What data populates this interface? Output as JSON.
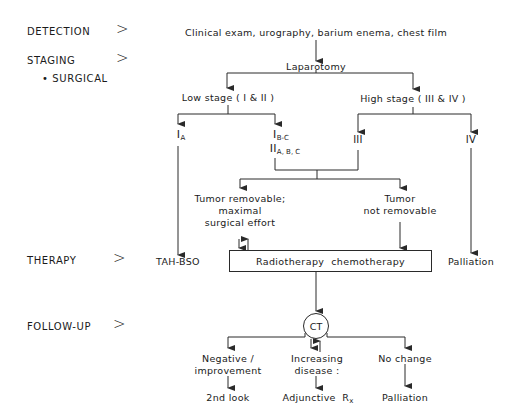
{
  "rows": {
    "detection": "DETECTION",
    "staging": "STAGING",
    "staging_sub": "• SURGICAL",
    "therapy": "THERAPY",
    "follow_up": "FOLLOW-UP",
    "separator": ">"
  },
  "detection": {
    "methods": "Clinical exam, urography, barium enema, chest film"
  },
  "staging": {
    "procedure": "Laparotomy",
    "low_stage": "Low stage ( I & II )",
    "high_stage": "High stage ( III & IV )",
    "stage_ia": {
      "main": "I",
      "sub": "A"
    },
    "stage_ib_c": {
      "main": "I",
      "sub": "B-C"
    },
    "stage_iia_c": {
      "main": "II",
      "sub": "A, B, C"
    },
    "stage_iii": "III",
    "stage_iv": "IV"
  },
  "surgery": {
    "removable_line1": "Tumor removable;",
    "removable_line2": "maximal",
    "removable_line3": "surgical effort",
    "not_removable_line1": "Tumor",
    "not_removable_line2": "not removable"
  },
  "therapy": {
    "tah_bso": "TAH-BSO",
    "radio_chemo": "Radiotherapy  chemotherapy",
    "palliation": "Palliation"
  },
  "follow_up": {
    "ct": "CT",
    "negative_line1": "Negative /",
    "negative_line2": "improvement",
    "negative_outcome": "2nd look",
    "increasing_line1": "Increasing",
    "increasing_line2": "disease :",
    "increasing_outcome": {
      "main": "Adjunctive  R",
      "sub": "x"
    },
    "no_change": "No change",
    "no_change_outcome": "Palliation"
  },
  "colors": {
    "line": "#2a2a2a",
    "text": "#1a1a1a",
    "background": "#ffffff"
  }
}
